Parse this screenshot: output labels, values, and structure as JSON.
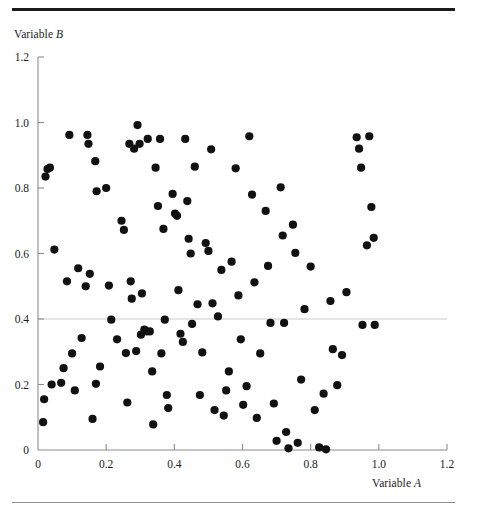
{
  "figure": {
    "top_rule_color": "#1b1b1b",
    "bottom_rule_color": "#8e8e8e",
    "axis_color": "#8c8c8c",
    "point_color": "#111111",
    "reference_line_color": "#c9c9c9"
  },
  "axis_labels": {
    "y_prefix": "Variable ",
    "y_var": "B",
    "x_prefix": "Variable ",
    "x_var": "A"
  },
  "chart_data": {
    "type": "scatter",
    "title": "",
    "xlabel": "Variable A",
    "ylabel": "Variable B",
    "xlim": [
      0,
      1.2
    ],
    "ylim": [
      0,
      1.2
    ],
    "xticks": [
      0,
      0.2,
      0.4,
      0.6,
      0.8,
      1.0,
      1.2
    ],
    "xticklabels": [
      "0",
      "0.2",
      "0.4",
      "0.6",
      "0.8",
      "1.0",
      "1.2"
    ],
    "yticks": [
      0,
      0.2,
      0.4,
      0.6,
      0.8,
      1.0,
      1.2
    ],
    "yticklabels": [
      "0",
      "0.2",
      "0.4",
      "0.6",
      "0.8",
      "1.0",
      "1.2"
    ],
    "grid": false,
    "legend": null,
    "marker": "filled-circle",
    "marker_size_px": 4.1,
    "annotations": [
      {
        "type": "horizontal-reference-line",
        "y": 0.4,
        "color": "#c9c9c9"
      }
    ],
    "n_points": 112,
    "points": [
      [
        0.015,
        0.085
      ],
      [
        0.018,
        0.155
      ],
      [
        0.022,
        0.835
      ],
      [
        0.028,
        0.858
      ],
      [
        0.035,
        0.862
      ],
      [
        0.04,
        0.2
      ],
      [
        0.048,
        0.612
      ],
      [
        0.068,
        0.205
      ],
      [
        0.075,
        0.25
      ],
      [
        0.085,
        0.515
      ],
      [
        0.092,
        0.962
      ],
      [
        0.1,
        0.295
      ],
      [
        0.108,
        0.182
      ],
      [
        0.118,
        0.555
      ],
      [
        0.128,
        0.342
      ],
      [
        0.14,
        0.5
      ],
      [
        0.145,
        0.962
      ],
      [
        0.148,
        0.935
      ],
      [
        0.152,
        0.538
      ],
      [
        0.16,
        0.095
      ],
      [
        0.168,
        0.882
      ],
      [
        0.17,
        0.202
      ],
      [
        0.172,
        0.79
      ],
      [
        0.182,
        0.255
      ],
      [
        0.2,
        0.8
      ],
      [
        0.208,
        0.502
      ],
      [
        0.215,
        0.398
      ],
      [
        0.232,
        0.338
      ],
      [
        0.245,
        0.7
      ],
      [
        0.252,
        0.672
      ],
      [
        0.258,
        0.296
      ],
      [
        0.262,
        0.145
      ],
      [
        0.268,
        0.935
      ],
      [
        0.272,
        0.515
      ],
      [
        0.275,
        0.462
      ],
      [
        0.282,
        0.92
      ],
      [
        0.288,
        0.302
      ],
      [
        0.292,
        0.992
      ],
      [
        0.298,
        0.935
      ],
      [
        0.302,
        0.352
      ],
      [
        0.305,
        0.478
      ],
      [
        0.312,
        0.368
      ],
      [
        0.318,
        0.362
      ],
      [
        0.322,
        0.95
      ],
      [
        0.328,
        0.362
      ],
      [
        0.335,
        0.24
      ],
      [
        0.338,
        0.078
      ],
      [
        0.345,
        0.862
      ],
      [
        0.352,
        0.745
      ],
      [
        0.358,
        0.95
      ],
      [
        0.362,
        0.295
      ],
      [
        0.368,
        0.675
      ],
      [
        0.372,
        0.398
      ],
      [
        0.378,
        0.168
      ],
      [
        0.382,
        0.128
      ],
      [
        0.395,
        0.782
      ],
      [
        0.402,
        0.722
      ],
      [
        0.408,
        0.715
      ],
      [
        0.412,
        0.488
      ],
      [
        0.418,
        0.355
      ],
      [
        0.425,
        0.33
      ],
      [
        0.432,
        0.95
      ],
      [
        0.438,
        0.76
      ],
      [
        0.442,
        0.645
      ],
      [
        0.448,
        0.6
      ],
      [
        0.452,
        0.385
      ],
      [
        0.46,
        0.865
      ],
      [
        0.468,
        0.445
      ],
      [
        0.475,
        0.168
      ],
      [
        0.482,
        0.298
      ],
      [
        0.492,
        0.632
      ],
      [
        0.5,
        0.608
      ],
      [
        0.508,
        0.918
      ],
      [
        0.512,
        0.448
      ],
      [
        0.518,
        0.122
      ],
      [
        0.528,
        0.408
      ],
      [
        0.538,
        0.55
      ],
      [
        0.545,
        0.105
      ],
      [
        0.552,
        0.182
      ],
      [
        0.56,
        0.24
      ],
      [
        0.568,
        0.575
      ],
      [
        0.58,
        0.86
      ],
      [
        0.588,
        0.472
      ],
      [
        0.595,
        0.338
      ],
      [
        0.602,
        0.138
      ],
      [
        0.612,
        0.195
      ],
      [
        0.62,
        0.958
      ],
      [
        0.628,
        0.78
      ],
      [
        0.635,
        0.512
      ],
      [
        0.642,
        0.098
      ],
      [
        0.652,
        0.295
      ],
      [
        0.668,
        0.73
      ],
      [
        0.675,
        0.562
      ],
      [
        0.682,
        0.388
      ],
      [
        0.692,
        0.142
      ],
      [
        0.7,
        0.028
      ],
      [
        0.712,
        0.802
      ],
      [
        0.718,
        0.655
      ],
      [
        0.722,
        0.388
      ],
      [
        0.728,
        0.055
      ],
      [
        0.735,
        0.005
      ],
      [
        0.748,
        0.688
      ],
      [
        0.755,
        0.602
      ],
      [
        0.762,
        0.022
      ],
      [
        0.772,
        0.215
      ],
      [
        0.782,
        0.43
      ],
      [
        0.8,
        0.56
      ],
      [
        0.812,
        0.122
      ],
      [
        0.825,
        0.008
      ],
      [
        0.838,
        0.172
      ],
      [
        0.845,
        0.002
      ],
      [
        0.858,
        0.455
      ],
      [
        0.865,
        0.308
      ],
      [
        0.878,
        0.198
      ],
      [
        0.892,
        0.29
      ],
      [
        0.905,
        0.482
      ],
      [
        0.935,
        0.955
      ],
      [
        0.942,
        0.92
      ],
      [
        0.948,
        0.862
      ],
      [
        0.952,
        0.382
      ],
      [
        0.965,
        0.625
      ],
      [
        0.972,
        0.958
      ],
      [
        0.978,
        0.742
      ],
      [
        0.985,
        0.648
      ],
      [
        0.988,
        0.382
      ]
    ]
  }
}
